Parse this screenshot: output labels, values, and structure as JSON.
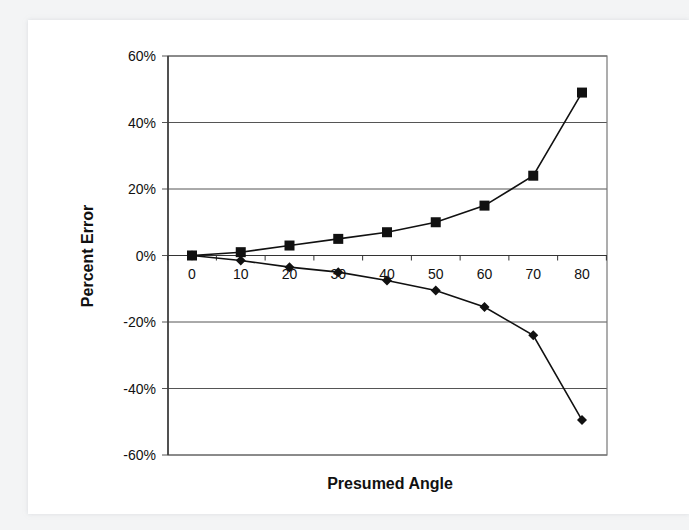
{
  "chart_data": {
    "type": "line",
    "title": "",
    "xlabel": "Presumed Angle",
    "ylabel": "Percent Error",
    "x": [
      0,
      10,
      20,
      30,
      40,
      50,
      60,
      70,
      80
    ],
    "x_tick_labels": [
      "0",
      "10",
      "20",
      "30",
      "40",
      "50",
      "60",
      "70",
      "80"
    ],
    "y_tick_labels": [
      "60%",
      "40%",
      "20%",
      "0%",
      "-20%",
      "-40%",
      "-60%"
    ],
    "y_ticks": [
      60,
      40,
      20,
      0,
      -20,
      -40,
      -60
    ],
    "ylim": [
      -60,
      60
    ],
    "xlim": [
      -5,
      85
    ],
    "grid": "horizontal",
    "legend": "none",
    "series": [
      {
        "name": "Positive error",
        "marker": "square",
        "values": [
          0,
          1,
          3,
          5,
          7,
          10,
          15,
          24,
          49
        ]
      },
      {
        "name": "Negative error",
        "marker": "diamond",
        "values": [
          0,
          -1.5,
          -3.5,
          -5,
          -7.5,
          -10.5,
          -15.5,
          -24,
          -49.5
        ]
      }
    ]
  },
  "colors": {
    "line": "#111111",
    "grid": "#555555",
    "border": "#777777",
    "background": "#ffffff"
  }
}
